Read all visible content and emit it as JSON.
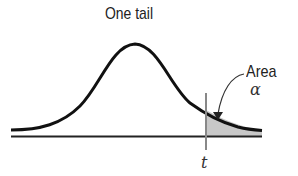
{
  "diagram": {
    "title": "One tail",
    "area_label": "Area",
    "alpha_label": "α",
    "t_label": "t",
    "colors": {
      "curve": "#111111",
      "baseline": "#222222",
      "shaded_area": "#c8c8c8",
      "critical_line": "#888888"
    }
  }
}
